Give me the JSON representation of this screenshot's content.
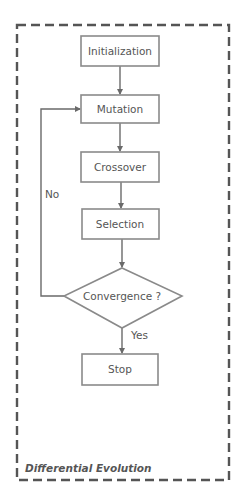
{
  "diagram": {
    "title": "Differential Evolution",
    "nodes": [
      {
        "id": "init",
        "label": "Initialization",
        "shape": "process"
      },
      {
        "id": "mutation",
        "label": "Mutation",
        "shape": "process"
      },
      {
        "id": "crossover",
        "label": "Crossover",
        "shape": "process"
      },
      {
        "id": "selection",
        "label": "Selection",
        "shape": "process"
      },
      {
        "id": "convergence",
        "label": "Convergence ?",
        "shape": "decision"
      },
      {
        "id": "stop",
        "label": "Stop",
        "shape": "process"
      }
    ],
    "edges": [
      {
        "from": "init",
        "to": "mutation",
        "label": ""
      },
      {
        "from": "mutation",
        "to": "crossover",
        "label": ""
      },
      {
        "from": "crossover",
        "to": "selection",
        "label": ""
      },
      {
        "from": "selection",
        "to": "convergence",
        "label": ""
      },
      {
        "from": "convergence",
        "to": "mutation",
        "label": "No"
      },
      {
        "from": "convergence",
        "to": "stop",
        "label": "Yes"
      }
    ],
    "colors": {
      "stroke": "#8a8a8a",
      "text": "#555555",
      "frame": "#555555"
    }
  }
}
